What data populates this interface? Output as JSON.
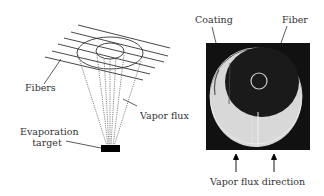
{
  "left_panel": {
    "labels": {
      "fibers": "Fibers",
      "vapor_flux": "Vapor flux",
      "evaporation_target_line1": "Evaporation",
      "evaporation_target_line2": "target"
    }
  },
  "right_panel": {
    "labels": {
      "coating": "Coating",
      "fiber": "Fiber",
      "vapor_flux_direction": "Vapor flux direction"
    }
  },
  "colors": {
    "line": "#333333",
    "target": "#000000",
    "micrograph_background": "#111111",
    "coating": "#d8d8d8",
    "fiber_core": "#1a1a1a",
    "fiber_ring": "#cfcfcf"
  }
}
